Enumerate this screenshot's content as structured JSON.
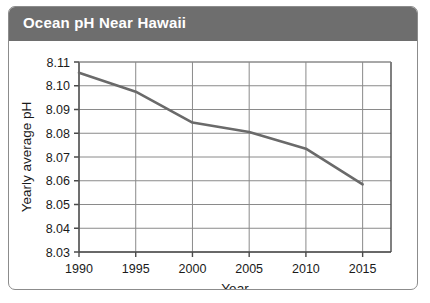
{
  "figure": {
    "title": "Ocean pH Near Hawaii",
    "title_bar_color": "#6e6e6e",
    "title_text_color": "#ffffff",
    "border_color": "#8c8c8c",
    "background_color": "#ffffff"
  },
  "chart_data": {
    "type": "line",
    "title": "Ocean pH Near Hawaii",
    "xlabel": "Year",
    "ylabel": "Yearly average pH",
    "x": [
      1990,
      1995,
      2000,
      2005,
      2010,
      2015
    ],
    "values": [
      8.1055,
      8.0975,
      8.0845,
      8.0805,
      8.0735,
      8.0585
    ],
    "series": [
      {
        "name": "Yearly average pH",
        "color": "#6a6a6a",
        "values": [
          8.1055,
          8.0975,
          8.0845,
          8.0805,
          8.0735,
          8.0585
        ]
      }
    ],
    "xlim": [
      1990,
      2017.5
    ],
    "ylim": [
      8.03,
      8.11
    ],
    "xticks": [
      1990,
      1995,
      2000,
      2005,
      2010,
      2015
    ],
    "xtick_labels": [
      "1990",
      "1995",
      "2000",
      "2005",
      "2010",
      "2015"
    ],
    "yticks": [
      8.03,
      8.04,
      8.05,
      8.06,
      8.07,
      8.08,
      8.09,
      8.1,
      8.11
    ],
    "ytick_labels": [
      "8.03",
      "8.04",
      "8.05",
      "8.06",
      "8.07",
      "8.08",
      "8.09",
      "8.10",
      "8.11"
    ],
    "grid": true,
    "grid_color": "#8a8a8a",
    "legend": false,
    "legend_position": "none"
  }
}
